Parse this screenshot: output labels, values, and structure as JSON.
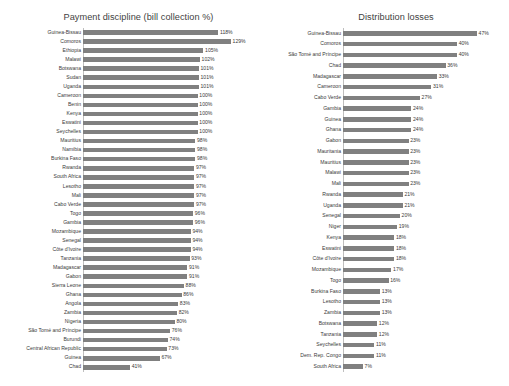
{
  "chart_data": [
    {
      "type": "bar",
      "orientation": "horizontal",
      "title": "Payment discipline (bill collection %)",
      "xlabel": "",
      "ylabel": "",
      "xlim": [
        0,
        129
      ],
      "grid": false,
      "legend": "none",
      "bar_color": "#808080",
      "value_suffix": "%",
      "categories": [
        "Guinea-Bissau",
        "Comoros",
        "Ethiopia",
        "Malawi",
        "Botswana",
        "Sudan",
        "Uganda",
        "Cameroon",
        "Benin",
        "Kenya",
        "Eswatini",
        "Seychelles",
        "Mauritius",
        "Namibia",
        "Burkina Faso",
        "Rwanda",
        "South Africa",
        "Lesotho",
        "Mali",
        "Cabo Verde",
        "Togo",
        "Gambia",
        "Mozambique",
        "Senegal",
        "Côte d'Ivoire",
        "Tanzania",
        "Madagascar",
        "Gabon",
        "Sierra Leone",
        "Ghana",
        "Angola",
        "Zambia",
        "Nigeria",
        "São Tomé and Príncipe",
        "Burundi",
        "Central African Republic",
        "Guinea",
        "Chad"
      ],
      "values": [
        118,
        129,
        105,
        102,
        101,
        101,
        101,
        100,
        100,
        100,
        100,
        100,
        98,
        98,
        98,
        97,
        97,
        97,
        97,
        97,
        96,
        96,
        94,
        94,
        94,
        93,
        91,
        91,
        88,
        86,
        83,
        82,
        80,
        76,
        74,
        73,
        67,
        41
      ],
      "value_labels": [
        "118%",
        "129%",
        "105%",
        "102%",
        "101%",
        "101%",
        "101%",
        "100%",
        "100%",
        "100%",
        "100%",
        "100%",
        "98%",
        "98%",
        "98%",
        "97%",
        "97%",
        "97%",
        "97%",
        "97%",
        "96%",
        "96%",
        "94%",
        "94%",
        "94%",
        "93%",
        "91%",
        "91%",
        "88%",
        "86%",
        "83%",
        "82%",
        "80%",
        "76%",
        "74%",
        "73%",
        "67%",
        "41%"
      ]
    },
    {
      "type": "bar",
      "orientation": "horizontal",
      "title": "Distribution losses",
      "xlabel": "",
      "ylabel": "",
      "xlim": [
        0,
        47
      ],
      "grid": false,
      "legend": "none",
      "bar_color": "#808080",
      "value_suffix": "%",
      "categories": [
        "Guinea-Bissau",
        "Comoros",
        "São Tomé and Príncipe",
        "Chad",
        "Madagascar",
        "Cameroon",
        "Cabo Verde",
        "Gambia",
        "Guinea",
        "Ghana",
        "Gabon",
        "Mauritania",
        "Mauritius",
        "Malawi",
        "Mali",
        "Rwanda",
        "Uganda",
        "Senegal",
        "Niger",
        "Kenya",
        "Eswatini",
        "Côte d'Ivoire",
        "Mozambique",
        "Togo",
        "Burkina Faso",
        "Lesotho",
        "Zambia",
        "Botswana",
        "Tanzania",
        "Seychelles",
        "Dem. Rep. Congo",
        "South Africa"
      ],
      "values": [
        47,
        40,
        40,
        36,
        33,
        31,
        27,
        24,
        24,
        24,
        23,
        23,
        23,
        23,
        23,
        21,
        21,
        20,
        19,
        18,
        18,
        18,
        17,
        16,
        13,
        13,
        13,
        12,
        12,
        11,
        11,
        7
      ],
      "value_labels": [
        "47%",
        "40%",
        "40%",
        "36%",
        "33%",
        "31%",
        "27%",
        "24%",
        "24%",
        "24%",
        "23%",
        "23%",
        "23%",
        "23%",
        "23%",
        "21%",
        "21%",
        "20%",
        "19%",
        "18%",
        "18%",
        "18%",
        "17%",
        "16%",
        "13%",
        "13%",
        "13%",
        "12%",
        "12%",
        "11%",
        "11%",
        "7%"
      ]
    }
  ]
}
